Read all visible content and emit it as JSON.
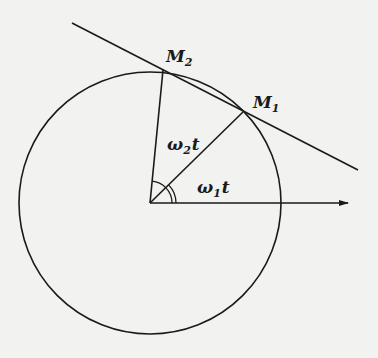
{
  "figure": {
    "labels": {
      "m2": {
        "base": "M",
        "sub": "2"
      },
      "m1": {
        "base": "M",
        "sub": "1"
      },
      "angle2": {
        "base": "ω",
        "sub": "2",
        "suffix": "t"
      },
      "angle1": {
        "base": "ω",
        "sub": "1",
        "suffix": "t"
      }
    },
    "colors": {
      "ink": "#1a1a1a",
      "paper": "#f2f2f0"
    }
  }
}
